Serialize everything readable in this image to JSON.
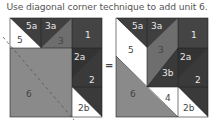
{
  "title": "Use diagonal corner technique to add unit 6.",
  "equals": "=",
  "colors": {
    "dark": "#3f3f3f",
    "darker": "#333333",
    "medium": "#6e6e6e",
    "gray6": "#8a8a8a",
    "white": "#ffffff"
  },
  "left_block": {
    "labels": {
      "u5a": "5a",
      "u3a": "3a",
      "u1": "1",
      "u5": "5",
      "u3": "3",
      "u2a": "2a",
      "u2": "2",
      "u2b": "2b",
      "u6": "6"
    }
  },
  "right_block": {
    "labels": {
      "u5a": "5a",
      "u3a": "3a",
      "u1": "1",
      "u5": "5",
      "u3": "3",
      "u3b": "3b",
      "u2a": "2a",
      "u2": "2",
      "u2b": "2b",
      "u4": "4",
      "u6": "6"
    }
  }
}
